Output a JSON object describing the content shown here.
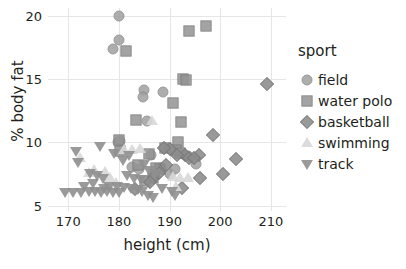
{
  "chart_data": {
    "type": "scatter",
    "title": "",
    "xlabel": "height (cm)",
    "ylabel": "% body fat",
    "xlim": [
      166,
      213
    ],
    "ylim": [
      4.6,
      20.6
    ],
    "xticks": [
      "170",
      "180",
      "190",
      "200",
      "210"
    ],
    "yticks": [
      "5",
      "10",
      "15",
      "20"
    ],
    "grid": true,
    "legend_position": "right",
    "legend_title": "sport",
    "series": [
      {
        "name": "field",
        "marker": "circle",
        "color": "#9f9f9f",
        "points": [
          [
            180.0,
            20.0
          ],
          [
            180.0,
            18.1
          ],
          [
            178.8,
            17.4
          ],
          [
            185.0,
            14.1
          ],
          [
            184.8,
            13.6
          ],
          [
            188.8,
            14.0
          ],
          [
            185.6,
            11.7
          ],
          [
            180.2,
            10.1
          ],
          [
            179.8,
            10.0
          ],
          [
            186.4,
            9.0
          ],
          [
            188.4,
            8.0
          ],
          [
            190.0,
            7.5
          ],
          [
            192.6,
            9.1
          ],
          [
            193.6,
            8.9
          ],
          [
            195.2,
            8.3
          ],
          [
            191.0,
            7.9
          ],
          [
            182.6,
            8.1
          ],
          [
            184.0,
            7.9
          ]
        ]
      },
      {
        "name": "water polo",
        "marker": "square",
        "color": "#949494",
        "points": [
          [
            181.4,
            17.2
          ],
          [
            193.8,
            18.8
          ],
          [
            197.2,
            19.2
          ],
          [
            192.6,
            15.0
          ],
          [
            193.2,
            14.9
          ],
          [
            190.6,
            13.1
          ],
          [
            192.3,
            11.6
          ],
          [
            183.4,
            11.8
          ],
          [
            180.0,
            10.2
          ],
          [
            191.6,
            10.0
          ],
          [
            180.2,
            9.3
          ],
          [
            186.0,
            9.1
          ],
          [
            183.8,
            8.2
          ],
          [
            187.4,
            8.0
          ],
          [
            188.2,
            7.9
          ],
          [
            186.8,
            7.2
          ],
          [
            191.2,
            9.4
          ],
          [
            192.0,
            9.2
          ],
          [
            189.2,
            9.6
          ],
          [
            185.2,
            7.0
          ]
        ]
      },
      {
        "name": "basketball",
        "marker": "diamond",
        "color": "#8c8c8c",
        "points": [
          [
            209.2,
            14.6
          ],
          [
            198.6,
            10.6
          ],
          [
            203.2,
            8.7
          ],
          [
            200.6,
            7.5
          ],
          [
            195.8,
            9.0
          ],
          [
            196.0,
            7.2
          ],
          [
            193.0,
            9.0
          ],
          [
            193.8,
            8.8
          ],
          [
            190.0,
            9.5
          ],
          [
            189.0,
            9.6
          ],
          [
            191.4,
            9.0
          ],
          [
            187.0,
            7.3
          ],
          [
            186.2,
            6.9
          ],
          [
            188.0,
            7.6
          ],
          [
            194.8,
            8.8
          ],
          [
            183.2,
            6.3
          ],
          [
            192.4,
            6.4
          ],
          [
            189.4,
            8.2
          ]
        ]
      },
      {
        "name": "swimming",
        "marker": "triangle-up",
        "color": "#d8d8d8",
        "points": [
          [
            186.6,
            11.7
          ],
          [
            181.0,
            9.4
          ],
          [
            182.6,
            9.4
          ],
          [
            184.2,
            9.5
          ],
          [
            172.4,
            8.8
          ],
          [
            175.0,
            7.8
          ],
          [
            177.2,
            7.7
          ],
          [
            178.2,
            7.2
          ],
          [
            190.6,
            7.3
          ],
          [
            192.0,
            7.2
          ],
          [
            193.6,
            7.2
          ],
          [
            179.4,
            6.8
          ],
          [
            174.0,
            7.6
          ],
          [
            191.2,
            6.5
          ]
        ]
      },
      {
        "name": "track",
        "marker": "triangle-down",
        "color": "#8f8f8f",
        "points": [
          [
            171.6,
            9.3
          ],
          [
            176.2,
            9.7
          ],
          [
            179.0,
            9.2
          ],
          [
            182.0,
            9.0
          ],
          [
            172.0,
            8.5
          ],
          [
            180.8,
            8.6
          ],
          [
            185.0,
            8.3
          ],
          [
            174.2,
            7.6
          ],
          [
            175.6,
            7.4
          ],
          [
            176.8,
            7.2
          ],
          [
            181.6,
            7.4
          ],
          [
            183.0,
            7.2
          ],
          [
            184.4,
            7.1
          ],
          [
            186.0,
            7.8
          ],
          [
            187.2,
            7.6
          ],
          [
            178.0,
            6.6
          ],
          [
            179.6,
            6.6
          ],
          [
            181.0,
            6.5
          ],
          [
            182.4,
            6.4
          ],
          [
            183.8,
            6.3
          ],
          [
            169.4,
            6.1
          ],
          [
            171.0,
            6.1
          ],
          [
            172.6,
            6.1
          ],
          [
            174.0,
            6.2
          ],
          [
            175.2,
            6.2
          ],
          [
            176.4,
            6.1
          ],
          [
            177.6,
            6.2
          ],
          [
            178.8,
            6.1
          ],
          [
            180.0,
            6.1
          ],
          [
            184.6,
            6.2
          ],
          [
            185.8,
            5.9
          ],
          [
            186.8,
            5.7
          ],
          [
            173.2,
            6.6
          ],
          [
            174.8,
            6.8
          ],
          [
            177.0,
            6.4
          ],
          [
            190.4,
            6.2
          ],
          [
            191.0,
            5.9
          ],
          [
            188.6,
            6.4
          ]
        ]
      }
    ]
  },
  "legend": {
    "title": "sport",
    "entries": [
      {
        "label": "field",
        "marker": "circle-icon"
      },
      {
        "label": "water polo",
        "marker": "square-icon"
      },
      {
        "label": "basketball",
        "marker": "diamond-icon"
      },
      {
        "label": "swimming",
        "marker": "triangle-up-icon"
      },
      {
        "label": "track",
        "marker": "triangle-down-icon"
      }
    ]
  },
  "axes": {
    "x_title": "height (cm)",
    "y_title": "% body fat",
    "x_ticks": [
      "170",
      "180",
      "190",
      "200",
      "210"
    ],
    "y_ticks": [
      "20",
      "15",
      "10",
      "5"
    ]
  }
}
